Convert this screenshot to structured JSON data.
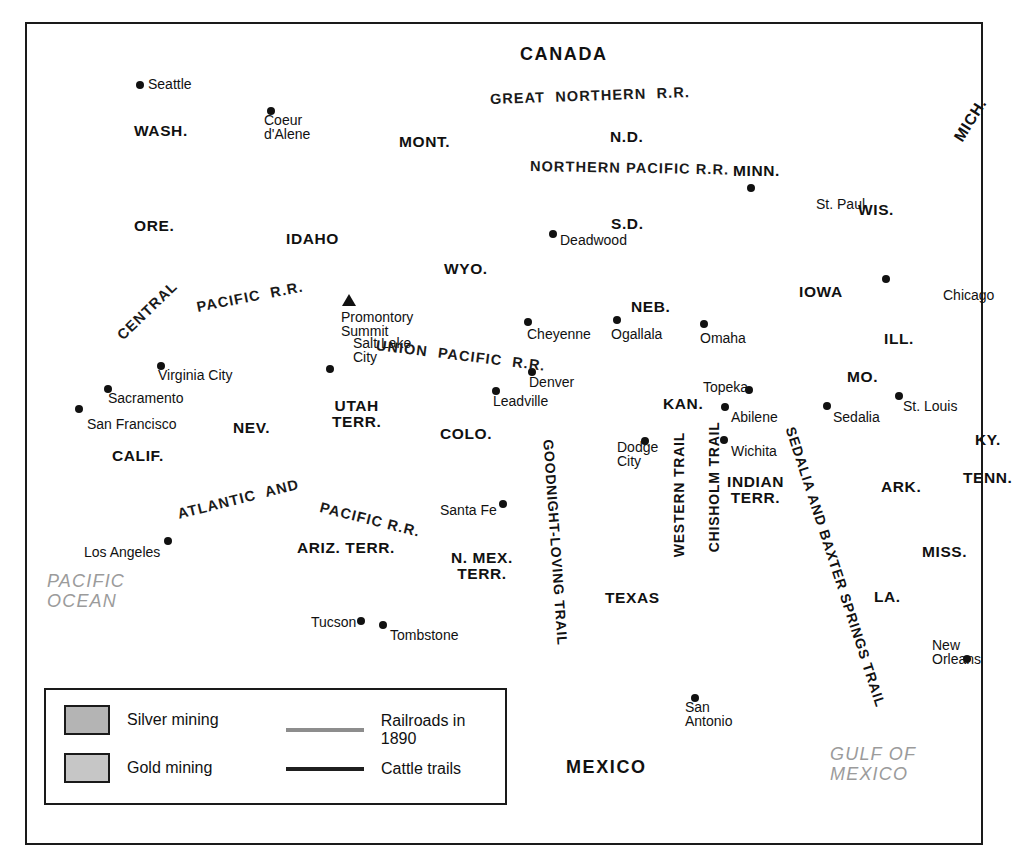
{
  "map": {
    "title": "Western Expansion, Mining, Railroads and Cattle Trails c. 1890",
    "colors": {
      "land": "#d8d8d8",
      "water": "#ffffff",
      "silver": "#b4b4b4",
      "gold": "#c6c6c6",
      "railroad": "#8d8d8d",
      "cattle_trail": "#1f1f1f",
      "border": "#1a1a1a",
      "ocean_label": "#9b9b9b"
    }
  },
  "legend": {
    "items": [
      {
        "kind": "swatch",
        "swatch": "silver",
        "label": "Silver mining"
      },
      {
        "kind": "swatch",
        "swatch": "gold",
        "label": "Gold mining"
      },
      {
        "kind": "line",
        "line": "railroad",
        "label": "Railroads in 1890"
      },
      {
        "kind": "line",
        "line": "trail",
        "label": "Cattle trails"
      }
    ]
  },
  "countries": [
    {
      "name": "CANADA",
      "x": 520,
      "y": 45
    },
    {
      "name": "MEXICO",
      "x": 566,
      "y": 758
    }
  ],
  "oceans": [
    {
      "name": "PACIFIC\nOCEAN",
      "x": 47,
      "y": 572
    },
    {
      "name": "GULF OF\nMEXICO",
      "x": 830,
      "y": 745
    }
  ],
  "states": [
    {
      "name": "WASH.",
      "x": 134,
      "y": 123
    },
    {
      "name": "ORE.",
      "x": 134,
      "y": 218
    },
    {
      "name": "IDAHO",
      "x": 286,
      "y": 231
    },
    {
      "name": "MONT.",
      "x": 399,
      "y": 134
    },
    {
      "name": "N.D.",
      "x": 610,
      "y": 129
    },
    {
      "name": "S.D.",
      "x": 611,
      "y": 216
    },
    {
      "name": "MINN.",
      "x": 733,
      "y": 163
    },
    {
      "name": "WIS.",
      "x": 858,
      "y": 202
    },
    {
      "name": "MICH.",
      "x": 958,
      "y": 132,
      "rotate": -58
    },
    {
      "name": "IOWA",
      "x": 799,
      "y": 284
    },
    {
      "name": "ILL.",
      "x": 884,
      "y": 331
    },
    {
      "name": "WYO.",
      "x": 444,
      "y": 261
    },
    {
      "name": "NEB.",
      "x": 631,
      "y": 299
    },
    {
      "name": "NEV.",
      "x": 233,
      "y": 420
    },
    {
      "name": "UTAH\nTERR.",
      "x": 332,
      "y": 398
    },
    {
      "name": "COLO.",
      "x": 440,
      "y": 426
    },
    {
      "name": "KAN.",
      "x": 663,
      "y": 396
    },
    {
      "name": "MO.",
      "x": 847,
      "y": 369
    },
    {
      "name": "KY.",
      "x": 975,
      "y": 432
    },
    {
      "name": "TENN.",
      "x": 963,
      "y": 470
    },
    {
      "name": "CALIF.",
      "x": 112,
      "y": 448
    },
    {
      "name": "ARIZ. TERR.",
      "x": 297,
      "y": 540
    },
    {
      "name": "N. MEX.\nTERR.",
      "x": 451,
      "y": 550
    },
    {
      "name": "INDIAN\nTERR.",
      "x": 727,
      "y": 474
    },
    {
      "name": "ARK.",
      "x": 881,
      "y": 479
    },
    {
      "name": "TEXAS",
      "x": 605,
      "y": 590
    },
    {
      "name": "MISS.",
      "x": 922,
      "y": 544
    },
    {
      "name": "LA.",
      "x": 874,
      "y": 589
    }
  ],
  "cities": [
    {
      "name": "Seattle",
      "dx": 148,
      "dy": 77,
      "px": 140,
      "py": 85
    },
    {
      "name": "Coeur\nd'Alene",
      "dx": 264,
      "dy": 113,
      "px": 271,
      "py": 111
    },
    {
      "name": "Deadwood",
      "dx": 560,
      "dy": 233,
      "px": 553,
      "py": 234
    },
    {
      "name": "St. Paul",
      "dx": 816,
      "dy": 197,
      "px": 751,
      "py": 188
    },
    {
      "name": "Chicago",
      "dx": 943,
      "dy": 288,
      "px": 886,
      "py": 279
    },
    {
      "name": "Promontory\nSummit",
      "dx": 341,
      "dy": 310,
      "px": 349,
      "py": 300
    },
    {
      "name": "Cheyenne",
      "dx": 527,
      "dy": 327,
      "px": 528,
      "py": 322
    },
    {
      "name": "Ogallala",
      "dx": 611,
      "dy": 327,
      "px": 617,
      "py": 320
    },
    {
      "name": "Omaha",
      "dx": 700,
      "dy": 331,
      "px": 704,
      "py": 324
    },
    {
      "name": "Virginia City",
      "dx": 158,
      "dy": 368,
      "px": 161,
      "py": 366
    },
    {
      "name": "Salt Lake\nCity",
      "dx": 353,
      "dy": 336,
      "px": 330,
      "py": 369
    },
    {
      "name": "Sacramento",
      "dx": 108,
      "dy": 391,
      "px": 108,
      "py": 389
    },
    {
      "name": "Denver",
      "dx": 529,
      "dy": 375,
      "px": 532,
      "py": 372
    },
    {
      "name": "Leadville",
      "dx": 493,
      "dy": 394,
      "px": 496,
      "py": 391
    },
    {
      "name": "Topeka",
      "dx": 703,
      "dy": 380,
      "px": 749,
      "py": 390
    },
    {
      "name": "Abilene",
      "dx": 731,
      "dy": 410,
      "px": 725,
      "py": 407
    },
    {
      "name": "Sedalia",
      "dx": 833,
      "dy": 410,
      "px": 827,
      "py": 406
    },
    {
      "name": "St. Louis",
      "dx": 903,
      "dy": 399,
      "px": 899,
      "py": 396
    },
    {
      "name": "San Francisco",
      "dx": 87,
      "dy": 417,
      "px": 79,
      "py": 409
    },
    {
      "name": "Wichita",
      "dx": 731,
      "dy": 444,
      "px": 724,
      "py": 440
    },
    {
      "name": "Dodge\nCity",
      "dx": 617,
      "dy": 440,
      "px": 645,
      "py": 441
    },
    {
      "name": "Santa Fe",
      "dx": 440,
      "dy": 503,
      "px": 503,
      "py": 504
    },
    {
      "name": "Los Angeles",
      "dx": 84,
      "dy": 545,
      "px": 168,
      "py": 541
    },
    {
      "name": "Tucson",
      "dx": 311,
      "dy": 615,
      "px": 361,
      "py": 621
    },
    {
      "name": "Tombstone",
      "dx": 390,
      "dy": 628,
      "px": 383,
      "py": 625
    },
    {
      "name": "New\nOrleans",
      "dx": 932,
      "dy": 638,
      "px": 967,
      "py": 659
    },
    {
      "name": "San\nAntonio",
      "dx": 685,
      "dy": 700,
      "px": 695,
      "py": 698
    }
  ],
  "railroad_labels": [
    {
      "name": "GREAT  NORTHERN  R.R.",
      "x": 490,
      "y": 92,
      "rotate": -2
    },
    {
      "name": "NORTHERN PACIFIC R.R.",
      "x": 530,
      "y": 159,
      "rotate": 1
    },
    {
      "name": "CENTRAL",
      "x": 120,
      "y": 330,
      "rotate": -44
    },
    {
      "name": "PACIFIC  R.R.",
      "x": 197,
      "y": 300,
      "rotate": -11
    },
    {
      "name": "UNION  PACIFIC  R.R.",
      "x": 376,
      "y": 338,
      "rotate": 7
    },
    {
      "name": "ATLANTIC  AND",
      "x": 178,
      "y": 507,
      "rotate": -14
    },
    {
      "name": "PACIFIC R.R.",
      "x": 320,
      "y": 500,
      "rotate": 14
    }
  ],
  "trail_labels": [
    {
      "name": "GOODNIGHT-LOVING TRAIL",
      "x": 548,
      "y": 432,
      "rotate": 86
    },
    {
      "name": "WESTERN TRAIL",
      "x": 679,
      "y": 550,
      "rotate": -90
    },
    {
      "name": "CHISHOLM TRAIL",
      "x": 714,
      "y": 545,
      "rotate": -90
    },
    {
      "name": "SEDALIA AND BAXTER SPRINGS TRAIL",
      "x": 790,
      "y": 420,
      "rotate": 72
    }
  ]
}
